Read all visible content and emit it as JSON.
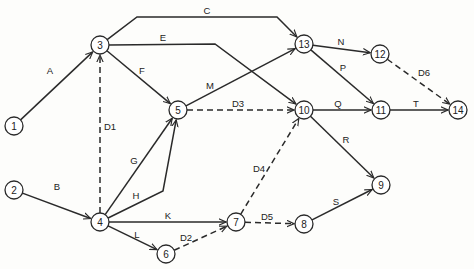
{
  "diagram": {
    "type": "activity-on-arrow network",
    "nodes": [
      {
        "id": "1",
        "x": 14,
        "y": 126
      },
      {
        "id": "2",
        "x": 14,
        "y": 190
      },
      {
        "id": "3",
        "x": 100,
        "y": 45
      },
      {
        "id": "4",
        "x": 100,
        "y": 222
      },
      {
        "id": "5",
        "x": 178,
        "y": 110
      },
      {
        "id": "6",
        "x": 166,
        "y": 254
      },
      {
        "id": "7",
        "x": 236,
        "y": 222
      },
      {
        "id": "8",
        "x": 304,
        "y": 224
      },
      {
        "id": "9",
        "x": 381,
        "y": 185
      },
      {
        "id": "10",
        "x": 304,
        "y": 110
      },
      {
        "id": "11",
        "x": 381,
        "y": 110
      },
      {
        "id": "12",
        "x": 380,
        "y": 54
      },
      {
        "id": "13",
        "x": 304,
        "y": 44
      },
      {
        "id": "14",
        "x": 458,
        "y": 110
      }
    ],
    "edges": [
      {
        "label": "A",
        "from": "1",
        "to": "3",
        "dummy": false,
        "points": [
          [
            14,
            126
          ],
          [
            100,
            45
          ]
        ],
        "label_pos": [
          50,
          70
        ]
      },
      {
        "label": "B",
        "from": "2",
        "to": "4",
        "dummy": false,
        "points": [
          [
            14,
            190
          ],
          [
            100,
            222
          ]
        ],
        "label_pos": [
          57,
          186
        ]
      },
      {
        "label": "C",
        "from": "3",
        "to": "13",
        "dummy": false,
        "points": [
          [
            100,
            45
          ],
          [
            137,
            17
          ],
          [
            277,
            17
          ],
          [
            304,
            44
          ]
        ],
        "label_pos": [
          207,
          10
        ]
      },
      {
        "label": "E",
        "from": "3",
        "to": "10",
        "dummy": false,
        "points": [
          [
            100,
            45
          ],
          [
            215,
            44
          ],
          [
            304,
            110
          ]
        ],
        "label_pos": [
          163,
          37
        ]
      },
      {
        "label": "F",
        "from": "3",
        "to": "5",
        "dummy": false,
        "points": [
          [
            100,
            45
          ],
          [
            178,
            110
          ]
        ],
        "label_pos": [
          142,
          70
        ]
      },
      {
        "label": "D1",
        "from": "4",
        "to": "3",
        "dummy": true,
        "points": [
          [
            100,
            222
          ],
          [
            100,
            45
          ]
        ],
        "label_pos": [
          110,
          126
        ]
      },
      {
        "label": "M",
        "from": "5",
        "to": "13",
        "dummy": false,
        "points": [
          [
            178,
            110
          ],
          [
            304,
            44
          ]
        ],
        "label_pos": [
          210,
          85
        ]
      },
      {
        "label": "D3",
        "from": "5",
        "to": "10",
        "dummy": true,
        "points": [
          [
            178,
            110
          ],
          [
            304,
            110
          ]
        ],
        "label_pos": [
          238,
          103
        ]
      },
      {
        "label": "G",
        "from": "4",
        "to": "5",
        "dummy": false,
        "points": [
          [
            100,
            222
          ],
          [
            178,
            110
          ]
        ],
        "label_pos": [
          134,
          160
        ]
      },
      {
        "label": "H",
        "from": "4",
        "to": "5",
        "dummy": false,
        "points": [
          [
            100,
            222
          ],
          [
            163,
            191
          ],
          [
            178,
            110
          ]
        ],
        "label_pos": [
          136,
          195
        ]
      },
      {
        "label": "K",
        "from": "4",
        "to": "7",
        "dummy": false,
        "points": [
          [
            100,
            222
          ],
          [
            236,
            222
          ]
        ],
        "label_pos": [
          168,
          215
        ]
      },
      {
        "label": "L",
        "from": "4",
        "to": "6",
        "dummy": false,
        "points": [
          [
            100,
            222
          ],
          [
            166,
            254
          ]
        ],
        "label_pos": [
          137,
          234
        ]
      },
      {
        "label": "D2",
        "from": "6",
        "to": "7",
        "dummy": true,
        "points": [
          [
            166,
            254
          ],
          [
            236,
            222
          ]
        ],
        "label_pos": [
          186,
          237
        ]
      },
      {
        "label": "D4",
        "from": "7",
        "to": "10",
        "dummy": true,
        "points": [
          [
            236,
            222
          ],
          [
            304,
            110
          ]
        ],
        "label_pos": [
          259,
          168
        ]
      },
      {
        "label": "D5",
        "from": "7",
        "to": "8",
        "dummy": true,
        "points": [
          [
            236,
            222
          ],
          [
            304,
            224
          ]
        ],
        "label_pos": [
          267,
          216
        ]
      },
      {
        "label": "S",
        "from": "8",
        "to": "9",
        "dummy": false,
        "points": [
          [
            304,
            224
          ],
          [
            381,
            185
          ]
        ],
        "label_pos": [
          336,
          201
        ]
      },
      {
        "label": "R",
        "from": "10",
        "to": "9",
        "dummy": false,
        "points": [
          [
            304,
            110
          ],
          [
            381,
            185
          ]
        ],
        "label_pos": [
          346,
          139
        ]
      },
      {
        "label": "Q",
        "from": "10",
        "to": "11",
        "dummy": false,
        "points": [
          [
            304,
            110
          ],
          [
            381,
            110
          ]
        ],
        "label_pos": [
          338,
          103
        ]
      },
      {
        "label": "N",
        "from": "13",
        "to": "12",
        "dummy": false,
        "points": [
          [
            304,
            44
          ],
          [
            380,
            54
          ]
        ],
        "label_pos": [
          341,
          41
        ]
      },
      {
        "label": "P",
        "from": "13",
        "to": "11",
        "dummy": false,
        "points": [
          [
            304,
            44
          ],
          [
            381,
            110
          ]
        ],
        "label_pos": [
          343,
          67
        ]
      },
      {
        "label": "D6",
        "from": "12",
        "to": "14",
        "dummy": true,
        "points": [
          [
            380,
            54
          ],
          [
            458,
            110
          ]
        ],
        "label_pos": [
          424,
          72
        ]
      },
      {
        "label": "T",
        "from": "11",
        "to": "14",
        "dummy": false,
        "points": [
          [
            381,
            110
          ],
          [
            458,
            110
          ]
        ],
        "label_pos": [
          416,
          103
        ]
      }
    ],
    "colors": {
      "line": "#2a2a2a",
      "node_fill": "#ffffff",
      "background": "#fdfdfb"
    },
    "node_radius": 9
  }
}
